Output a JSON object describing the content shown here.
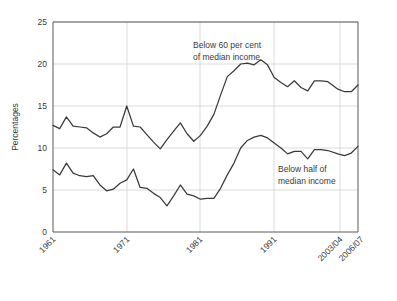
{
  "chart_data": {
    "type": "line",
    "title": "",
    "xlabel": "",
    "ylabel": "Percentages",
    "ylim": [
      0,
      25
    ],
    "yticks": [
      0,
      5,
      10,
      15,
      20,
      25
    ],
    "xticks": [
      "1961",
      "1971",
      "1981",
      "1991",
      "2003/04",
      "2006/07"
    ],
    "xtick_positions": [
      1961,
      1971,
      1981,
      1991,
      2003.5,
      2006.5
    ],
    "grid": true,
    "legend_position": "inline-annotations",
    "x": [
      1961,
      1962,
      1963,
      1964,
      1965,
      1966,
      1967,
      1968,
      1969,
      1970,
      1971,
      1972,
      1973,
      1974,
      1975,
      1976,
      1977,
      1978,
      1979,
      1980,
      1981,
      1982,
      1983,
      1984,
      1985,
      1986,
      1987,
      1988,
      1989,
      1990,
      1991,
      1992,
      1993,
      1994,
      1995,
      1996,
      1997,
      1998,
      1999,
      2000,
      2001,
      2002,
      2003.5,
      2004.5,
      2005.5,
      2006.5
    ],
    "series": [
      {
        "name": "Below 60 per cent of median income",
        "label_line1": "Below 60 per cent",
        "label_line2": "of median income",
        "color": "#3a3a3a",
        "values": [
          12.7,
          12.3,
          13.7,
          12.6,
          12.5,
          12.4,
          11.8,
          11.3,
          11.7,
          12.5,
          12.5,
          15.0,
          12.6,
          12.5,
          11.6,
          10.7,
          9.9,
          11.0,
          12.0,
          13.0,
          11.7,
          10.8,
          11.5,
          12.6,
          14.0,
          16.3,
          18.5,
          19.2,
          20.0,
          20.1,
          19.9,
          20.5,
          19.9,
          18.4,
          17.8,
          17.3,
          18.0,
          17.2,
          16.8,
          18.0,
          18.0,
          17.9,
          17.0,
          16.7,
          16.7,
          17.5
        ]
      },
      {
        "name": "Below half of median income",
        "label_line1": "Below half of",
        "label_line2": "median income",
        "color": "#3a3a3a",
        "values": [
          7.4,
          6.8,
          8.2,
          7.0,
          6.7,
          6.6,
          6.7,
          5.6,
          4.9,
          5.1,
          5.8,
          6.2,
          7.5,
          5.3,
          5.2,
          4.6,
          4.1,
          3.1,
          4.3,
          5.6,
          4.5,
          4.3,
          3.9,
          4.0,
          4.0,
          5.2,
          6.8,
          8.2,
          10.0,
          10.9,
          11.3,
          11.5,
          11.2,
          10.6,
          10.0,
          9.3,
          9.6,
          9.6,
          8.7,
          9.8,
          9.8,
          9.7,
          9.3,
          9.1,
          9.4,
          10.2
        ]
      }
    ]
  },
  "annotations": {
    "upper": {
      "line1": "Below 60 per cent",
      "line2": "of median income"
    },
    "lower": {
      "line1": "Below half of",
      "line2": "median income"
    }
  },
  "axes": {
    "y_title": "Percentages",
    "y_ticks": [
      "0",
      "5",
      "10",
      "15",
      "20",
      "25"
    ],
    "x_ticks": [
      "1961",
      "1971",
      "1981",
      "1991",
      "2003/04",
      "2006/07"
    ]
  },
  "colors": {
    "line": "#3a3a3a",
    "grid": "#d2d2d2",
    "axis": "#5a5a5a",
    "background": "#ffffff",
    "text": "#3a3a3a"
  }
}
